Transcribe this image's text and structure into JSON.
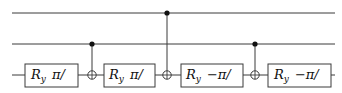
{
  "diagram": {
    "type": "quantum-circuit",
    "colors": {
      "wire": "#3a3a3a",
      "control_dot": "#111111",
      "background": "#ffffff"
    },
    "wires": [
      {
        "id": "q0",
        "y": 13
      },
      {
        "id": "q1",
        "y": 44
      },
      {
        "id": "q2",
        "y": 75
      }
    ],
    "gates": [
      {
        "type": "Ry",
        "wire": 2,
        "op": "R",
        "sub": "y",
        "angle": "π/"
      },
      {
        "type": "CNOT",
        "control": 1,
        "target": 2
      },
      {
        "type": "Ry",
        "wire": 2,
        "op": "R",
        "sub": "y",
        "angle": "π/"
      },
      {
        "type": "CNOT",
        "control": 0,
        "target": 2
      },
      {
        "type": "Ry",
        "wire": 2,
        "op": "R",
        "sub": "y",
        "angle": "−π/"
      },
      {
        "type": "CNOT",
        "control": 1,
        "target": 2
      },
      {
        "type": "Ry",
        "wire": 2,
        "op": "R",
        "sub": "y",
        "angle": "−π/"
      }
    ]
  }
}
